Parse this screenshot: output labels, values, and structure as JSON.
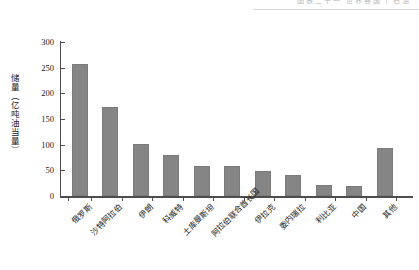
{
  "header": {
    "text": "图表二十一  世界各国 | 石油"
  },
  "chart_data": {
    "type": "bar",
    "title": "",
    "xlabel": "",
    "ylabel": "储量（亿吨油当量）",
    "ylim": [
      0,
      300
    ],
    "yticks": [
      0,
      50,
      100,
      150,
      200,
      250,
      300
    ],
    "grid": false,
    "legend": "none",
    "bar_color": "#858585",
    "axis_color": "#4d4d4d",
    "categories": [
      "俄罗斯",
      "沙特阿拉伯",
      "伊朗",
      "科威特",
      "土库曼斯坦",
      "阿拉伯联合酋长国",
      "伊拉克",
      "委内瑞拉",
      "利比亚",
      "中国",
      "其他"
    ],
    "values": [
      258,
      174,
      101,
      79,
      59,
      58,
      48,
      40,
      22,
      19,
      94
    ]
  }
}
